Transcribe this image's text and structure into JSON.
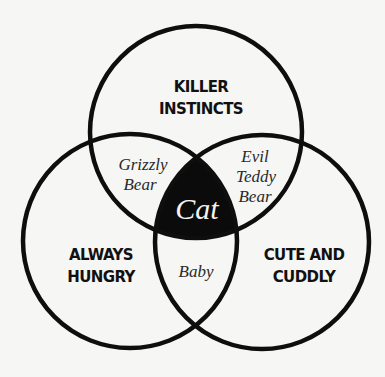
{
  "diagram": {
    "type": "venn",
    "sets": [
      {
        "id": "top",
        "lines": [
          "KILLER",
          "INSTINCTS"
        ]
      },
      {
        "id": "left",
        "lines": [
          "ALWAYS",
          "HUNGRY"
        ]
      },
      {
        "id": "right",
        "lines": [
          "CUTE AND",
          "CUDDLY"
        ]
      }
    ],
    "intersections": {
      "top_left": {
        "lines": [
          "Grizzly",
          "Bear"
        ]
      },
      "top_right": {
        "lines": [
          "Evil",
          "Teddy",
          "Bear"
        ]
      },
      "left_right": {
        "lines": [
          "Baby"
        ]
      },
      "all": {
        "label": "Cat"
      }
    },
    "colors": {
      "stroke": "#0e0e0e",
      "center_fill": "#0b0b0b",
      "center_text": "#f4f4f2",
      "background": "#f6f6f4"
    }
  }
}
